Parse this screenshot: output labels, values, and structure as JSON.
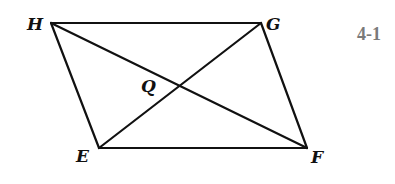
{
  "figure_label": "4-1",
  "points": {
    "H": {
      "label": "H",
      "x": 51,
      "y": 23
    },
    "G": {
      "label": "G",
      "x": 261,
      "y": 23
    },
    "E": {
      "label": "E",
      "x": 99,
      "y": 148
    },
    "F": {
      "label": "F",
      "x": 307,
      "y": 148
    },
    "Q": {
      "label": "Q",
      "x": 178,
      "y": 87
    }
  },
  "segments": [
    "HG",
    "GF",
    "FE",
    "EH",
    "HF",
    "EG"
  ]
}
